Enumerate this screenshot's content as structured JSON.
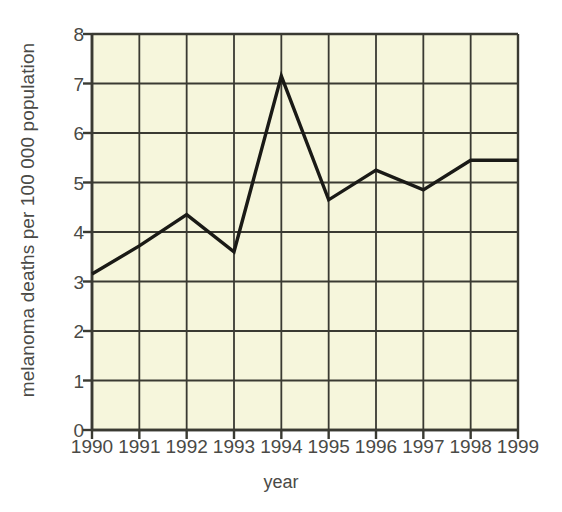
{
  "chart_data": {
    "type": "line",
    "title": "",
    "xlabel": "year",
    "ylabel": "melanoma deaths per 100 000 population",
    "categories": [
      "1990",
      "1991",
      "1992",
      "1993",
      "1994",
      "1995",
      "1996",
      "1997",
      "1998",
      "1999"
    ],
    "x": [
      1990,
      1991,
      1992,
      1993,
      1994,
      1995,
      1996,
      1997,
      1998,
      1999
    ],
    "values": [
      3.15,
      3.72,
      4.35,
      3.6,
      7.15,
      4.65,
      5.25,
      4.85,
      5.45,
      5.45
    ],
    "series": [
      {
        "name": "melanoma deaths per 100 000 population",
        "values": [
          3.15,
          3.72,
          4.35,
          3.6,
          7.15,
          4.65,
          5.25,
          4.85,
          5.45,
          5.45
        ]
      }
    ],
    "ylim": [
      0,
      8
    ],
    "yticks": [
      0,
      1,
      2,
      3,
      4,
      5,
      6,
      7,
      8
    ],
    "ytick_labels": [
      "0",
      "1",
      "2",
      "3",
      "4",
      "5",
      "6",
      "7",
      "8"
    ],
    "xlim": [
      1990,
      1999
    ],
    "grid": true,
    "legend": false,
    "legend_position": "none",
    "colors": {
      "plot_background": "#f6f6dc",
      "grid": "#3a3a32",
      "line": "#1a1a16",
      "text": "#4a4a46",
      "page_background": "#ffffff"
    }
  }
}
